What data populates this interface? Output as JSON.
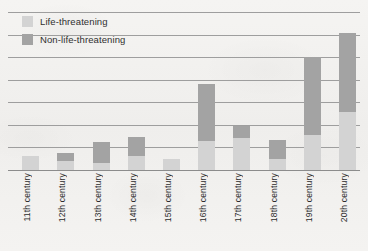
{
  "chart_data": {
    "type": "bar",
    "title": "",
    "subtitle": "",
    "xlabel": "",
    "ylabel": "",
    "stacked": true,
    "grid": true,
    "gridlines": 8,
    "ylim": [
      0,
      7
    ],
    "y_tick_values": [
      0,
      1,
      2,
      3,
      4,
      5,
      6,
      7
    ],
    "y_tick_labels": [
      "",
      "",
      "",
      "",
      "",
      "",
      "",
      ""
    ],
    "legend_position": "top-left",
    "categories": [
      "11th century",
      "12th century",
      "13th century",
      "14th century",
      "15th century",
      "16th century",
      "17th century",
      "18th century",
      "19th century",
      "20th century"
    ],
    "series": [
      {
        "name": "Life-threatening",
        "color": "#d3d3d3",
        "values": [
          0.6,
          0.4,
          0.3,
          0.6,
          0.5,
          1.3,
          1.4,
          0.5,
          1.55,
          2.55
        ]
      },
      {
        "name": "Non-life-threatening",
        "color": "#a3a3a3",
        "values": [
          0.0,
          0.35,
          0.95,
          0.85,
          0.0,
          2.5,
          0.55,
          0.85,
          3.45,
          3.5
        ]
      }
    ],
    "totals": [
      0.6,
      0.75,
      1.25,
      1.45,
      0.5,
      3.8,
      1.95,
      1.35,
      5.0,
      6.05
    ]
  },
  "legend": {
    "items": [
      {
        "label": "Life-threatening",
        "swatch": "light-gray-swatch",
        "color": "#d3d3d3"
      },
      {
        "label": "Non-life-threatening",
        "swatch": "dark-gray-swatch",
        "color": "#a3a3a3"
      }
    ]
  },
  "colors": {
    "background": "#f3f2f0",
    "gridline": "#9e9e9e",
    "axis": "#8c8c8c",
    "life_threatening": "#d3d3d3",
    "non_life_threatening": "#a3a3a3",
    "text": "#2b2b2b"
  }
}
